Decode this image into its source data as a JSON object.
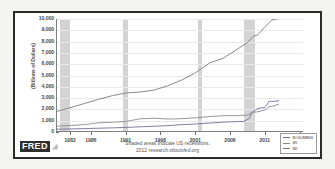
{
  "card": {
    "source_logo": "FRED",
    "footnote_line1": "Shaded areas indicate US recessions.",
    "footnote_line2": "2012 research.stlouisfed.org"
  },
  "legend": {
    "position": "bottom-right",
    "entries": [
      {
        "label": "BOGUMBNS",
        "color": "#6f6f9c"
      },
      {
        "label": "M1",
        "color": "#8a8a8a"
      },
      {
        "label": "M2",
        "color": "#7a7a7a"
      }
    ]
  },
  "chart_data": {
    "type": "line",
    "title": "",
    "xlabel": "",
    "ylabel": "(Billions of Dollars)",
    "ylim": [
      0,
      10000
    ],
    "xlim": [
      1981,
      2016.5
    ],
    "grid": true,
    "ytick_labels": [
      "10,000",
      "9,000",
      "8,000",
      "7,000",
      "6,000",
      "5,000",
      "4,000",
      "3,000",
      "2,000",
      "1,000",
      "0"
    ],
    "ytick_values": [
      10000,
      9000,
      8000,
      7000,
      6000,
      5000,
      4000,
      3000,
      2000,
      1000,
      0
    ],
    "xtick_labels": [
      "1983",
      "1986",
      "1991",
      "1996",
      "2001",
      "2006",
      "2011",
      "2016"
    ],
    "xtick_values": [
      1983,
      1986,
      1991,
      1996,
      2001,
      2006,
      2011,
      2016
    ],
    "recession_bands": [
      {
        "start": 1981.5,
        "end": 1982.9
      },
      {
        "start": 1990.5,
        "end": 1991.2
      },
      {
        "start": 2001.2,
        "end": 2001.9
      },
      {
        "start": 2007.9,
        "end": 2009.5
      }
    ],
    "series": [
      {
        "name": "BOGUMBNS",
        "color": "#6f6f9c",
        "x": [
          1981,
          1983,
          1985,
          1987,
          1989,
          1991,
          1993,
          1995,
          1997,
          1999,
          2001,
          2003,
          2005,
          2007,
          2008.0,
          2008.7,
          2009.2,
          2010,
          2011,
          2011.6,
          2012.3,
          2013
        ],
        "values": [
          160,
          185,
          215,
          250,
          280,
          320,
          375,
          425,
          480,
          570,
          625,
          710,
          790,
          840,
          860,
          1100,
          1700,
          2020,
          2100,
          2650,
          2650,
          2700
        ]
      },
      {
        "name": "M1",
        "color": "#8a8a8a",
        "x": [
          1981,
          1983,
          1985,
          1987,
          1989,
          1991,
          1993,
          1995,
          1997,
          1999,
          2001,
          2003,
          2005,
          2007,
          2008.5,
          2009.2,
          2010,
          2011,
          2011.6,
          2012.3,
          2013
        ],
        "values": [
          430,
          490,
          580,
          730,
          780,
          860,
          1090,
          1140,
          1070,
          1100,
          1180,
          1290,
          1370,
          1370,
          1420,
          1650,
          1720,
          1870,
          2150,
          2250,
          2400
        ]
      },
      {
        "name": "M2",
        "color": "#7a7a7a",
        "x": [
          1981,
          1983,
          1985,
          1987,
          1989,
          1991,
          1993,
          1995,
          1997,
          1999,
          2001,
          2003,
          2005,
          2007,
          2008.5,
          2009.3,
          2010,
          2011,
          2012,
          2013
        ],
        "values": [
          1750,
          2100,
          2460,
          2830,
          3160,
          3400,
          3480,
          3650,
          4040,
          4550,
          5200,
          6070,
          6500,
          7300,
          7900,
          8450,
          8600,
          9300,
          9900,
          10050
        ]
      }
    ]
  }
}
